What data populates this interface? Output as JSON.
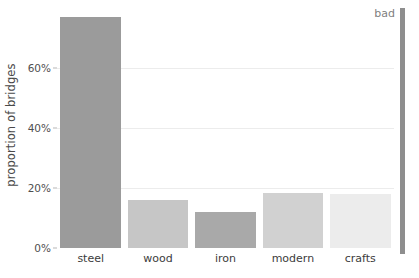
{
  "annotation": {
    "label": "bad"
  },
  "chart_data": {
    "type": "bar",
    "title": "",
    "subtitle": "",
    "xlabel": "",
    "ylabel": "proportion of bridges",
    "categories": [
      "steel",
      "wood",
      "iron",
      "modern",
      "crafts"
    ],
    "values": [
      77,
      16,
      12,
      18.5,
      18
    ],
    "bar_colors": [
      "#9b9b9b",
      "#c6c6c6",
      "#a9a9a9",
      "#d1d1d1",
      "#ececec"
    ],
    "ylim": [
      0,
      80
    ],
    "ytick_values": [
      0,
      20,
      40,
      60
    ],
    "ytick_labels": [
      "0%",
      "20%",
      "40%",
      "60%"
    ],
    "grid": true,
    "grid_color": "#ececec",
    "legend": "none",
    "background": "#ffffff"
  }
}
